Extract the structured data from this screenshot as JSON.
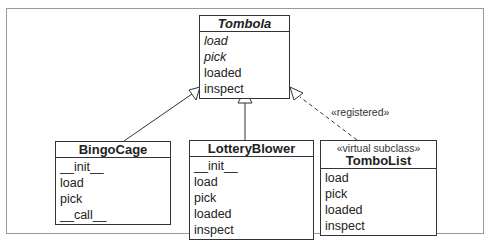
{
  "diagram": {
    "type": "uml-class",
    "classes": [
      {
        "id": "tombola",
        "name": "Tombola",
        "abstract": true,
        "stereotype": null,
        "operations": [
          {
            "name": "load",
            "abstract": true
          },
          {
            "name": "pick",
            "abstract": true
          },
          {
            "name": "loaded",
            "abstract": false
          },
          {
            "name": "inspect",
            "abstract": false
          }
        ]
      },
      {
        "id": "bingocage",
        "name": "BingoCage",
        "abstract": false,
        "stereotype": null,
        "operations": [
          {
            "name": "__init__",
            "abstract": false
          },
          {
            "name": "load",
            "abstract": false
          },
          {
            "name": "pick",
            "abstract": false
          },
          {
            "name": "__call__",
            "abstract": false
          }
        ]
      },
      {
        "id": "lotteryblower",
        "name": "LotteryBlower",
        "abstract": false,
        "stereotype": null,
        "operations": [
          {
            "name": "__init__",
            "abstract": false
          },
          {
            "name": "load",
            "abstract": false
          },
          {
            "name": "pick",
            "abstract": false
          },
          {
            "name": "loaded",
            "abstract": false
          },
          {
            "name": "inspect",
            "abstract": false
          }
        ]
      },
      {
        "id": "tombolist",
        "name": "TomboList",
        "abstract": false,
        "stereotype": "«virtual subclass»",
        "operations": [
          {
            "name": "load",
            "abstract": false
          },
          {
            "name": "pick",
            "abstract": false
          },
          {
            "name": "loaded",
            "abstract": false
          },
          {
            "name": "inspect",
            "abstract": false
          }
        ]
      }
    ],
    "relations": [
      {
        "from": "BingoCage",
        "to": "Tombola",
        "kind": "inheritance",
        "style": "solid"
      },
      {
        "from": "LotteryBlower",
        "to": "Tombola",
        "kind": "inheritance",
        "style": "solid"
      },
      {
        "from": "TomboList",
        "to": "Tombola",
        "kind": "realization",
        "style": "dashed",
        "label": "«registered»"
      }
    ],
    "colors": {
      "line": "#333333",
      "frame": "#9a9a9a",
      "background": "#ffffff"
    }
  }
}
